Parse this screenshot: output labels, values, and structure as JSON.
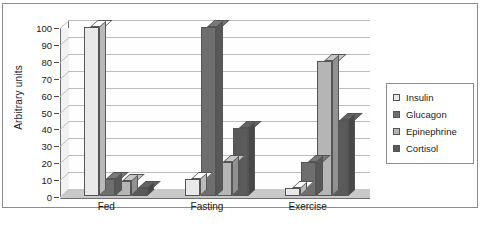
{
  "chart_data": {
    "type": "bar",
    "title": "",
    "subtitle": "",
    "xlabel": "",
    "ylabel": "Arbitrary units",
    "categories": [
      "Fed",
      "Fasting",
      "Exercise"
    ],
    "series": [
      {
        "name": "Insulin",
        "color": "#e9e9e9",
        "values": [
          100,
          10,
          5
        ]
      },
      {
        "name": "Glucagon",
        "color": "#6e6e6e",
        "values": [
          10,
          100,
          20
        ]
      },
      {
        "name": "Epinephrine",
        "color": "#b5b5b5",
        "values": [
          9,
          20,
          80
        ]
      },
      {
        "name": "Cortisol",
        "color": "#5a5a5a",
        "values": [
          5,
          40,
          45
        ]
      }
    ],
    "ylim": [
      0,
      100
    ],
    "yticks": [
      0,
      10,
      20,
      30,
      40,
      50,
      60,
      70,
      80,
      90,
      100
    ],
    "ytick_labels": [
      "0",
      "10",
      "20",
      "30",
      "40",
      "50",
      "60",
      "70",
      "80",
      "90",
      "100"
    ],
    "grid": true,
    "grid_axis": "y",
    "legend_position": "right",
    "style": "3d-bar",
    "legend_entries": [
      "Insulin",
      "Glucagon",
      "Epinephrine",
      "Cortisol"
    ]
  },
  "axes": {
    "y_title": "Arbitrary units"
  },
  "legend": {
    "items": [
      {
        "label": "Insulin"
      },
      {
        "label": "Glucagon"
      },
      {
        "label": "Epinephrine"
      },
      {
        "label": "Cortisol"
      }
    ]
  }
}
